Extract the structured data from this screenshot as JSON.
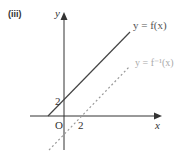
{
  "part_label": "(iii)",
  "axes": {
    "x_label": "x",
    "y_label": "y",
    "origin_label": "O"
  },
  "ticks": {
    "y_intercept": "2",
    "x_intercept": "2"
  },
  "curves": [
    {
      "name": "f",
      "label": "y = f(x)",
      "style": "solid",
      "color": "#444444"
    },
    {
      "name": "f-inverse",
      "label": "y = f⁻¹(x)",
      "style": "dashed",
      "color": "#9a9a9a"
    }
  ]
}
